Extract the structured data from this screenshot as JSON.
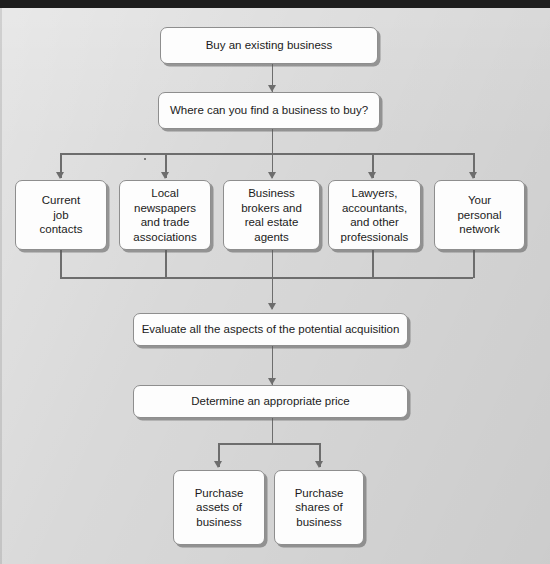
{
  "diagram": {
    "background_color": "#d9d9d9",
    "node_fill_color": "#fdfdfd",
    "node_border_color": "#8e8e8e",
    "connector_color": "#6d6d6d",
    "nodes": {
      "start": "Buy an existing business",
      "question": "Where can you find a business to buy?",
      "source_1": "Current\njob\ncontacts",
      "source_2": "Local\nnewspapers\nand trade\nassociations",
      "source_3": "Business\nbrokers and\nreal estate\nagents",
      "source_4": "Lawyers,\naccountants,\nand other\nprofessionals",
      "source_5": "Your\npersonal\nnetwork",
      "evaluate": "Evaluate all the aspects of the potential acquisition",
      "price": "Determine an appropriate price",
      "outcome_1": "Purchase\nassets of\nbusiness",
      "outcome_2": "Purchase\nshares of\nbusiness"
    }
  }
}
